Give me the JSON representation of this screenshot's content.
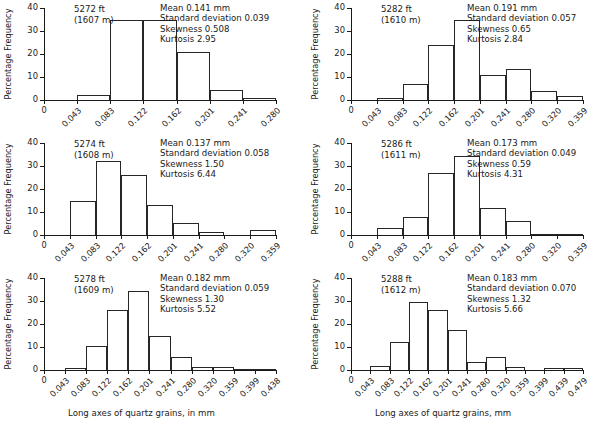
{
  "figure": {
    "axis_y_title": "Percentage Frequency",
    "xlabel_left": "Long axes of quartz grains, in mm",
    "xlabel_right": "Long axes of quartz grains, mm",
    "y_ticks": [
      "0",
      "10",
      "20",
      "30",
      "40"
    ],
    "stat_labels": {
      "mean": "Mean",
      "sd": "Standard deviation",
      "skewness": "Skewness",
      "kurtosis": "Kurtosis"
    }
  },
  "chart_data": [
    {
      "type": "bar",
      "title": "5272 ft\n(1607 m)",
      "depth_ft": "5272 ft",
      "depth_m": "(1607 m)",
      "xlabel": "",
      "ylabel": "Percentage Frequency",
      "ylim": [
        0,
        40
      ],
      "yticks": [
        0,
        10,
        20,
        30,
        40
      ],
      "edges": [
        "0",
        "0.043",
        "0.083",
        "0.122",
        "0.162",
        "0.201",
        "0.241",
        "0.280"
      ],
      "categories": [
        "0-0.043",
        "0.043-0.083",
        "0.083-0.122",
        "0.122-0.162",
        "0.162-0.201",
        "0.201-0.241",
        "0.241-0.280"
      ],
      "values": [
        0,
        2.1,
        35.0,
        35.0,
        20.8,
        4.5,
        1.0
      ],
      "stats": {
        "mean": "0.141 mm",
        "standard_deviation": "0.039",
        "skewness": "0.508",
        "kurtosis": "2.95"
      },
      "stats_text": "Mean 0.141 mm\nStandard deviation 0.039\nSkewness 0.508\nKurtosis 2.95"
    },
    {
      "type": "bar",
      "title": "5282 ft\n(1610 m)",
      "depth_ft": "5282 ft",
      "depth_m": "(1610 m)",
      "xlabel": "",
      "ylabel": "Percentage Frequency",
      "ylim": [
        0,
        40
      ],
      "yticks": [
        0,
        10,
        20,
        30,
        40
      ],
      "edges": [
        "0",
        "0.043",
        "0.083",
        "0.122",
        "0.162",
        "0.201",
        "0.241",
        "0.280",
        "0.320",
        "0.359"
      ],
      "categories": [
        "0-0.043",
        "0.043-0.083",
        "0.083-0.122",
        "0.122-0.162",
        "0.162-0.201",
        "0.201-0.241",
        "0.241-0.280",
        "0.280-0.320",
        "0.320-0.359"
      ],
      "values": [
        0,
        1.0,
        6.8,
        23.9,
        34.6,
        10.8,
        13.4,
        3.8,
        1.8
      ],
      "stats": {
        "mean": "0.191 mm",
        "standard_deviation": "0.057",
        "skewness": "0.65",
        "kurtosis": "2.84"
      },
      "stats_text": "Mean 0.191 mm\nStandard deviation 0.057\nSkewness 0.65\nKurtosis 2.84"
    },
    {
      "type": "bar",
      "title": "5274 ft\n(1608 m)",
      "depth_ft": "5274 ft",
      "depth_m": "(1608 m)",
      "xlabel": "",
      "ylabel": "Percentage Frequency",
      "ylim": [
        0,
        40
      ],
      "yticks": [
        0,
        10,
        20,
        30,
        40
      ],
      "edges": [
        "0",
        "0.043",
        "0.083",
        "0.122",
        "0.162",
        "0.201",
        "0.241",
        "0.280",
        "0.320",
        "0.359"
      ],
      "categories": [
        "0-0.043",
        "0.043-0.083",
        "0.083-0.122",
        "0.122-0.162",
        "0.162-0.201",
        "0.201-0.241",
        "0.241-0.280",
        "0.280-0.320",
        "0.320-0.359"
      ],
      "values": [
        0,
        14.6,
        32.3,
        26.1,
        13.1,
        5.1,
        1.3,
        0,
        2.0
      ],
      "stats": {
        "mean": "0.137 mm",
        "standard_deviation": "0.058",
        "skewness": "1.50",
        "kurtosis": "6.44"
      },
      "stats_text": "Mean 0.137 mm\nStandard deviation 0.058\nSkewness 1.50\nKurtosis 6.44"
    },
    {
      "type": "bar",
      "title": "5286 ft\n(1611 m)",
      "depth_ft": "5286 ft",
      "depth_m": "(1611 m)",
      "xlabel": "",
      "ylabel": "Percentage Frequency",
      "ylim": [
        0,
        40
      ],
      "yticks": [
        0,
        10,
        20,
        30,
        40
      ],
      "edges": [
        "0",
        "0.043",
        "0.083",
        "0.122",
        "0.162",
        "0.201",
        "0.241",
        "0.280",
        "0.320",
        "0.359"
      ],
      "categories": [
        "0-0.043",
        "0.043-0.083",
        "0.083-0.122",
        "0.122-0.162",
        "0.162-0.201",
        "0.201-0.241",
        "0.241-0.280",
        "0.280-0.320",
        "0.320-0.359"
      ],
      "values": [
        0,
        2.9,
        7.7,
        26.9,
        34.5,
        11.9,
        6.3,
        0.5,
        0.5
      ],
      "stats": {
        "mean": "0.173 mm",
        "standard_deviation": "0.049",
        "skewness": "0.59",
        "kurtosis": "4.31"
      },
      "stats_text": "Mean 0.173 mm\nStandard deviation 0.049\nSkewness 0.59\nKurtosis 4.31"
    },
    {
      "type": "bar",
      "title": "5278 ft\n(1609 m)",
      "depth_ft": "5278 ft",
      "depth_m": "(1609 m)",
      "xlabel": "Long axes of quartz grains, in mm",
      "ylabel": "Percentage Frequency",
      "ylim": [
        0,
        40
      ],
      "yticks": [
        0,
        10,
        20,
        30,
        40
      ],
      "edges": [
        "0",
        "0.043",
        "0.083",
        "0.122",
        "0.162",
        "0.201",
        "0.241",
        "0.280",
        "0.320",
        "0.359",
        "0.399",
        "0.438"
      ],
      "categories": [
        "0-0.043",
        "0.043-0.083",
        "0.083-0.122",
        "0.122-0.162",
        "0.162-0.201",
        "0.201-0.241",
        "0.241-0.280",
        "0.280-0.320",
        "0.320-0.359",
        "0.359-0.399",
        "0.399-0.438"
      ],
      "values": [
        0,
        0.9,
        10.6,
        25.9,
        34.4,
        14.9,
        5.5,
        1.5,
        1.5,
        0.5,
        0.5
      ],
      "stats": {
        "mean": "0.182 mm",
        "standard_deviation": "0.059",
        "skewness": "1.30",
        "kurtosis": "5.52"
      },
      "stats_text": "Mean 0.182 mm\nStandard deviation 0.059\nSkewness 1.30\nKurtosis 5.52"
    },
    {
      "type": "bar",
      "title": "5288 ft\n(1612 m)",
      "depth_ft": "5288 ft",
      "depth_m": "(1612 m)",
      "xlabel": "Long axes of quartz grains, mm",
      "ylabel": "Percentage Frequency",
      "ylim": [
        0,
        40
      ],
      "yticks": [
        0,
        10,
        20,
        30,
        40
      ],
      "edges": [
        "0",
        "0.043",
        "0.083",
        "0.122",
        "0.162",
        "0.201",
        "0.241",
        "0.280",
        "0.320",
        "0.359",
        "0.399",
        "0.439",
        "0.479"
      ],
      "categories": [
        "0-0.043",
        "0.043-0.083",
        "0.083-0.122",
        "0.122-0.162",
        "0.162-0.201",
        "0.201-0.241",
        "0.241-0.280",
        "0.280-0.320",
        "0.320-0.359",
        "0.359-0.399",
        "0.399-0.439",
        "0.439-0.479"
      ],
      "values": [
        0,
        1.8,
        12.2,
        29.5,
        26.0,
        17.4,
        3.4,
        5.6,
        1.5,
        0,
        1.0,
        1.0
      ],
      "stats": {
        "mean": "0.183 mm",
        "standard_deviation": "0.070",
        "skewness": "1.32",
        "kurtosis": "5.66"
      },
      "stats_text": "Mean 0.183 mm\nStandard deviation 0.070\nSkewness 1.32\nKurtosis 5.66"
    }
  ]
}
